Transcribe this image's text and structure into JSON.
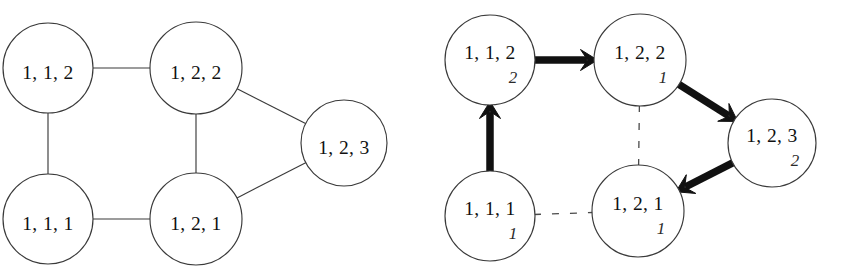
{
  "figure": {
    "panels": [
      {
        "name": "undirected-graph",
        "type": "graph",
        "nodes": [
          {
            "id": "n112",
            "label": "1, 1, 2",
            "sub": "",
            "cx": 48,
            "cy": 68,
            "r": 45
          },
          {
            "id": "n122",
            "label": "1, 2, 2",
            "sub": "",
            "cx": 196,
            "cy": 68,
            "r": 46
          },
          {
            "id": "n123",
            "label": "1, 2, 3",
            "sub": "",
            "cx": 344,
            "cy": 143,
            "r": 43
          },
          {
            "id": "n111",
            "label": "1, 1, 1",
            "sub": "",
            "cx": 48,
            "cy": 219,
            "r": 45
          },
          {
            "id": "n121",
            "label": "1, 2, 1",
            "sub": "",
            "cx": 196,
            "cy": 219,
            "r": 46
          }
        ],
        "edges": [
          {
            "from": "n112",
            "to": "n122",
            "style": "solid"
          },
          {
            "from": "n112",
            "to": "n111",
            "style": "solid"
          },
          {
            "from": "n122",
            "to": "n121",
            "style": "solid"
          },
          {
            "from": "n122",
            "to": "n123",
            "style": "solid"
          },
          {
            "from": "n111",
            "to": "n121",
            "style": "solid"
          },
          {
            "from": "n121",
            "to": "n123",
            "style": "solid"
          }
        ]
      },
      {
        "name": "directed-graph",
        "type": "graph",
        "nodes": [
          {
            "id": "n112",
            "label": "1, 1, 2",
            "sub": "2",
            "cx": 68,
            "cy": 60,
            "r": 45
          },
          {
            "id": "n122",
            "label": "1, 2, 2",
            "sub": "1",
            "cx": 218,
            "cy": 60,
            "r": 46
          },
          {
            "id": "n123",
            "label": "1, 2, 3",
            "sub": "2",
            "cx": 350,
            "cy": 143,
            "r": 44
          },
          {
            "id": "n111",
            "label": "1, 1, 1",
            "sub": "1",
            "cx": 68,
            "cy": 216,
            "r": 45
          },
          {
            "id": "n121",
            "label": "1, 2, 1",
            "sub": "1",
            "cx": 216,
            "cy": 211,
            "r": 46
          }
        ],
        "edges": [
          {
            "from": "n112",
            "to": "n122",
            "style": "arrow"
          },
          {
            "from": "n111",
            "to": "n112",
            "style": "arrow"
          },
          {
            "from": "n122",
            "to": "n123",
            "style": "arrow"
          },
          {
            "from": "n123",
            "to": "n121",
            "style": "arrow"
          },
          {
            "from": "n122",
            "to": "n121",
            "style": "dashed"
          },
          {
            "from": "n111",
            "to": "n121",
            "style": "dashed"
          }
        ]
      }
    ]
  },
  "colors": {
    "stroke": "#3a3a3a",
    "arrow": "#111111",
    "node_fill": "#ffffff",
    "background": "#ffffff",
    "text": "#111111"
  }
}
